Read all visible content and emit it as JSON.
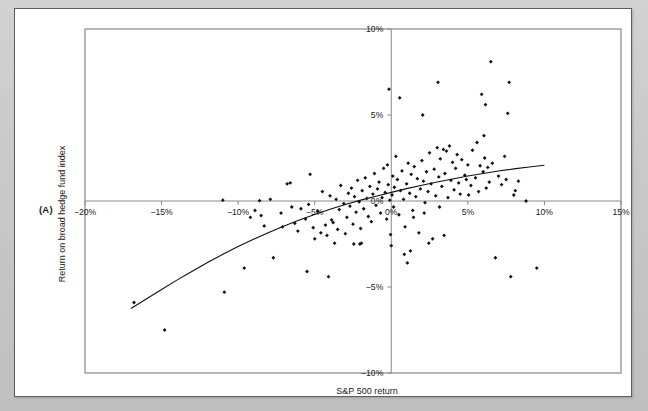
{
  "panel": {
    "letter": "(A)"
  },
  "chart_data": {
    "type": "scatter",
    "title": "",
    "xlabel": "S&P 500 return",
    "ylabel": "Return on broad hedge fund index",
    "xlim": [
      -20,
      15
    ],
    "ylim": [
      -10,
      10
    ],
    "grid": false,
    "legend": null,
    "xticks": [
      -20,
      -15,
      -10,
      -5,
      0,
      5,
      10,
      15
    ],
    "xticklabels": [
      "−20%",
      "−15%",
      "−10%",
      "−5%",
      "0%",
      "5%",
      "10%",
      "15%"
    ],
    "yticks": [
      -10,
      -5,
      0,
      5,
      10
    ],
    "yticklabels": [
      "−10%",
      "−5%",
      "0%",
      "5%",
      "10%"
    ],
    "axis_lines": {
      "x_axis_at_y": 0,
      "y_axis_at_x": 0
    },
    "series": [
      {
        "name": "Monthly observations",
        "marker": "diamond",
        "color": "#111111",
        "points": [
          [
            -16.8,
            -5.9
          ],
          [
            -14.8,
            -7.5
          ],
          [
            -11.0,
            0.05
          ],
          [
            -10.9,
            -5.3
          ],
          [
            -9.6,
            -3.9
          ],
          [
            -8.9,
            -0.55
          ],
          [
            -8.6,
            0.02
          ],
          [
            -8.5,
            -0.85
          ],
          [
            -8.3,
            -1.45
          ],
          [
            -7.7,
            -3.3
          ],
          [
            -7.2,
            -0.7
          ],
          [
            -7.1,
            -1.5
          ],
          [
            -6.8,
            1.0
          ],
          [
            -6.6,
            1.05
          ],
          [
            -6.5,
            -0.35
          ],
          [
            -6.3,
            -1.3
          ],
          [
            -6.1,
            -1.75
          ],
          [
            -5.9,
            -0.45
          ],
          [
            -5.6,
            -1.05
          ],
          [
            -5.5,
            -4.1
          ],
          [
            -5.4,
            -0.2
          ],
          [
            -5.3,
            1.55
          ],
          [
            -5.1,
            -1.55
          ],
          [
            -5.0,
            -2.2
          ],
          [
            -4.8,
            -0.6
          ],
          [
            -4.6,
            -1.85
          ],
          [
            -4.5,
            0.55
          ],
          [
            -4.3,
            -1.4
          ],
          [
            -4.2,
            -2.0
          ],
          [
            -4.1,
            -4.4
          ],
          [
            -4.0,
            0.3
          ],
          [
            -3.9,
            -1.1
          ],
          [
            -3.8,
            -1.25
          ],
          [
            -3.6,
            0.1
          ],
          [
            -3.5,
            -1.65
          ],
          [
            -3.4,
            -0.5
          ],
          [
            -3.3,
            0.9
          ],
          [
            -3.1,
            -0.15
          ],
          [
            -3.0,
            -1.9
          ],
          [
            -2.9,
            -0.95
          ],
          [
            -2.8,
            0.45
          ],
          [
            -2.7,
            -0.3
          ],
          [
            -2.6,
            0.75
          ],
          [
            -2.5,
            -1.35
          ],
          [
            -2.4,
            0.25
          ],
          [
            -2.3,
            -0.65
          ],
          [
            -2.2,
            1.2
          ],
          [
            -2.1,
            -0.05
          ],
          [
            -2.0,
            -1.6
          ],
          [
            -1.9,
            0.6
          ],
          [
            -1.8,
            -0.45
          ],
          [
            -1.7,
            1.35
          ],
          [
            -1.6,
            0.15
          ],
          [
            -1.5,
            -0.9
          ],
          [
            -1.4,
            0.85
          ],
          [
            -1.3,
            -1.2
          ],
          [
            -1.2,
            0.4
          ],
          [
            -1.1,
            1.6
          ],
          [
            -1.0,
            -0.25
          ],
          [
            -0.9,
            0.7
          ],
          [
            -0.8,
            1.1
          ],
          [
            -0.7,
            -0.7
          ],
          [
            -0.6,
            0.2
          ],
          [
            -0.5,
            1.9
          ],
          [
            -0.4,
            0.5
          ],
          [
            -0.3,
            -1.05
          ],
          [
            -0.25,
            2.1
          ],
          [
            -0.2,
            0.95
          ],
          [
            -0.15,
            6.5
          ],
          [
            -0.1,
            0.05
          ],
          [
            0.0,
            -2.6
          ],
          [
            0.05,
            0.35
          ],
          [
            0.1,
            1.45
          ],
          [
            0.15,
            -0.35
          ],
          [
            0.2,
            0.8
          ],
          [
            0.3,
            2.6
          ],
          [
            0.4,
            1.25
          ],
          [
            0.5,
            -0.8
          ],
          [
            0.55,
            6.0
          ],
          [
            0.6,
            0.6
          ],
          [
            0.7,
            1.75
          ],
          [
            0.8,
            0.1
          ],
          [
            0.9,
            -1.5
          ],
          [
            1.0,
            1.0
          ],
          [
            1.05,
            -3.6
          ],
          [
            1.1,
            2.2
          ],
          [
            1.2,
            0.45
          ],
          [
            1.3,
            1.55
          ],
          [
            1.4,
            -0.55
          ],
          [
            1.5,
            2.0
          ],
          [
            1.6,
            0.25
          ],
          [
            1.7,
            1.3
          ],
          [
            1.8,
            -1.85
          ],
          [
            1.9,
            0.7
          ],
          [
            2.0,
            2.35
          ],
          [
            2.05,
            5.0
          ],
          [
            2.1,
            1.15
          ],
          [
            2.2,
            -0.1
          ],
          [
            2.3,
            1.7
          ],
          [
            2.4,
            0.55
          ],
          [
            2.5,
            2.8
          ],
          [
            2.6,
            1.0
          ],
          [
            2.7,
            -2.2
          ],
          [
            2.8,
            1.85
          ],
          [
            2.9,
            0.3
          ],
          [
            3.0,
            3.1
          ],
          [
            3.05,
            6.9
          ],
          [
            3.1,
            1.4
          ],
          [
            3.2,
            2.45
          ],
          [
            3.3,
            0.85
          ],
          [
            3.4,
            3.0
          ],
          [
            3.5,
            1.6
          ],
          [
            3.6,
            2.9
          ],
          [
            3.7,
            0.2
          ],
          [
            3.8,
            3.2
          ],
          [
            3.9,
            1.2
          ],
          [
            4.0,
            2.25
          ],
          [
            4.1,
            0.65
          ],
          [
            4.2,
            1.9
          ],
          [
            4.3,
            2.7
          ],
          [
            4.4,
            1.05
          ],
          [
            4.5,
            0.4
          ],
          [
            4.6,
            2.4
          ],
          [
            4.8,
            1.5
          ],
          [
            5.0,
            2.1
          ],
          [
            5.2,
            0.9
          ],
          [
            5.3,
            2.95
          ],
          [
            5.5,
            1.35
          ],
          [
            5.6,
            3.4
          ],
          [
            5.7,
            0.55
          ],
          [
            5.8,
            2.05
          ],
          [
            5.9,
            6.2
          ],
          [
            6.0,
            1.7
          ],
          [
            6.05,
            3.8
          ],
          [
            6.1,
            2.5
          ],
          [
            6.15,
            5.6
          ],
          [
            6.2,
            0.75
          ],
          [
            6.3,
            1.95
          ],
          [
            6.4,
            1.1
          ],
          [
            6.5,
            8.1
          ],
          [
            6.6,
            2.2
          ],
          [
            6.8,
            -3.3
          ],
          [
            7.0,
            1.45
          ],
          [
            7.2,
            0.95
          ],
          [
            7.4,
            2.6
          ],
          [
            7.5,
            1.25
          ],
          [
            7.6,
            5.1
          ],
          [
            7.7,
            6.9
          ],
          [
            7.8,
            -4.4
          ],
          [
            8.0,
            0.35
          ],
          [
            8.1,
            0.6
          ],
          [
            8.3,
            1.15
          ],
          [
            8.8,
            0.0
          ],
          [
            9.5,
            -3.9
          ],
          [
            2.45,
            -2.45
          ],
          [
            3.45,
            -2.0
          ],
          [
            1.25,
            -2.9
          ],
          [
            0.85,
            -3.1
          ],
          [
            -0.05,
            -1.95
          ],
          [
            4.9,
            1.25
          ],
          [
            5.05,
            0.35
          ],
          [
            3.15,
            -0.35
          ],
          [
            2.15,
            -0.7
          ],
          [
            1.45,
            -0.95
          ],
          [
            -7.9,
            0.1
          ],
          [
            -9.2,
            -0.95
          ],
          [
            -2.05,
            -2.5
          ],
          [
            -3.7,
            -2.45
          ],
          [
            -1.95,
            -2.45
          ],
          [
            -2.45,
            -2.5
          ]
        ]
      }
    ],
    "fit_curve": {
      "name": "Fitted concave regression",
      "color": "#111111",
      "x_start": -17.0,
      "x_end": 10.0,
      "points": [
        [
          -17.0,
          -6.25
        ],
        [
          -16.0,
          -5.7
        ],
        [
          -15.0,
          -5.15
        ],
        [
          -14.0,
          -4.6
        ],
        [
          -13.0,
          -4.08
        ],
        [
          -12.0,
          -3.58
        ],
        [
          -11.0,
          -3.1
        ],
        [
          -10.0,
          -2.65
        ],
        [
          -9.0,
          -2.23
        ],
        [
          -8.0,
          -1.83
        ],
        [
          -7.0,
          -1.45
        ],
        [
          -6.0,
          -1.1
        ],
        [
          -5.0,
          -0.78
        ],
        [
          -4.0,
          -0.48
        ],
        [
          -3.0,
          -0.2
        ],
        [
          -2.0,
          0.05
        ],
        [
          -1.0,
          0.28
        ],
        [
          0.0,
          0.5
        ],
        [
          1.0,
          0.72
        ],
        [
          2.0,
          0.92
        ],
        [
          3.0,
          1.1
        ],
        [
          4.0,
          1.28
        ],
        [
          5.0,
          1.45
        ],
        [
          6.0,
          1.6
        ],
        [
          7.0,
          1.74
        ],
        [
          8.0,
          1.87
        ],
        [
          9.0,
          1.98
        ],
        [
          10.0,
          2.08
        ]
      ]
    }
  }
}
